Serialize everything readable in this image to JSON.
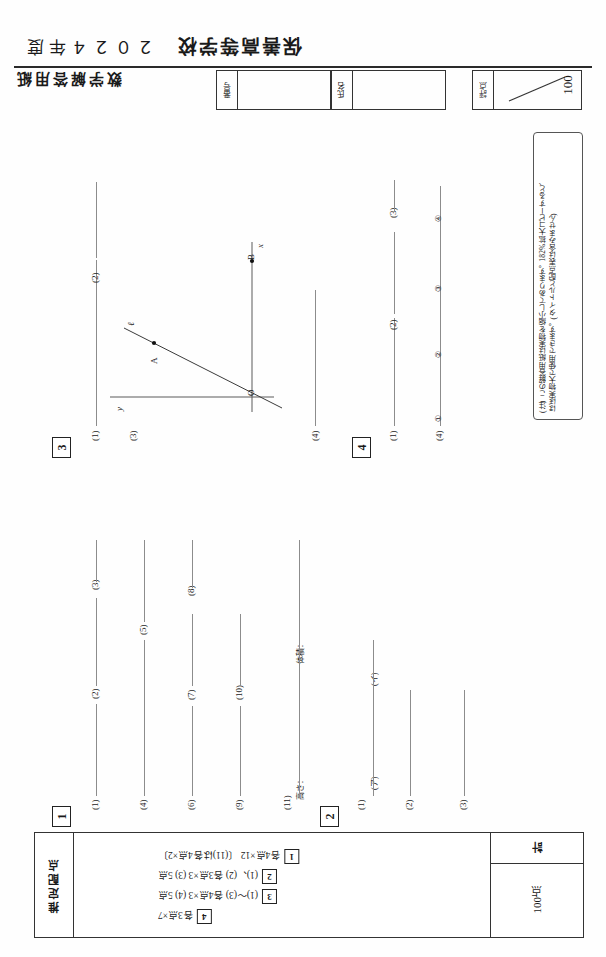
{
  "header": {
    "year": "２０２４年度",
    "school": "保善高等学校",
    "sheet_title": "数学解答用紙",
    "number_label": "番号",
    "name_label": "氏名",
    "score_label": "評点",
    "score_max": "100"
  },
  "note": {
    "line1": "(注)  この解答用紙は実物を縮小してあります。182%拡大コピーすると、",
    "line2": "ほぼ実物大で使用できます。(タイトルと配点表は含みません)"
  },
  "questions": {
    "q1": {
      "number": "1",
      "items": [
        "(1)",
        "(2)",
        "(3)",
        "(4)",
        "(5)",
        "(6)",
        "(7)",
        "(8)",
        "(9)",
        "(10)",
        "(11)"
      ],
      "item11_sub": [
        "高さ：",
        "体積："
      ]
    },
    "q2": {
      "number": "2",
      "items": [
        "(1)",
        "(2)",
        "(3)"
      ],
      "item1_sub": [
        "(ア)",
        "(イ)"
      ]
    },
    "q3": {
      "number": "3",
      "items": [
        "(1)",
        "(2)",
        "(3)",
        "(4)"
      ],
      "figure": {
        "axis_x": "x",
        "axis_y": "y",
        "line_label": "ℓ",
        "point_a": "A",
        "point_b": "B",
        "origin": "O"
      }
    },
    "q4": {
      "number": "4",
      "items": [
        "(1)",
        "(2)",
        "(3)",
        "(4)"
      ],
      "item4_sub": [
        "①",
        "②",
        "③",
        "④"
      ]
    }
  },
  "allocation": {
    "label": "推定配点",
    "rows": [
      {
        "box": "1",
        "text": "各4点×12  〔(11)は各4点×2〕"
      },
      {
        "box": "2",
        "text": "(1)、(2)  各3点×3   (3)  5点"
      },
      {
        "box": "3",
        "text": "(1)〜(3)  各4点×3   (4)  5点"
      },
      {
        "box": "4",
        "text": "各3点×7"
      }
    ],
    "total_label": "計",
    "total_value": "100点"
  }
}
